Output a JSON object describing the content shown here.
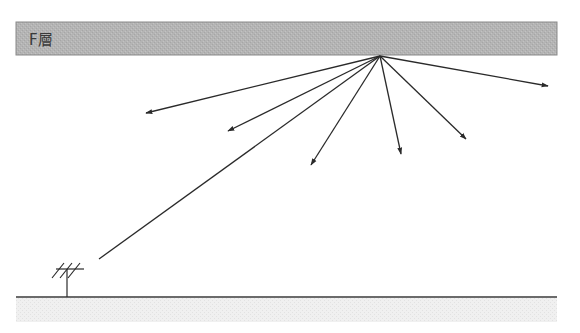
{
  "diagram": {
    "type": "ionospheric-reflection",
    "layer": {
      "label": "F層",
      "fill_color": "#b4b4b4",
      "border_color": "#8a8a8a"
    },
    "incident_ray": {
      "from": "antenna",
      "to": "reflection-point"
    },
    "reflected_rays": {
      "count": 7,
      "color": "#2a2a2a"
    },
    "antenna": {
      "kind": "yagi",
      "elements": 3
    },
    "ground": {
      "line_color": "#3a3a3a",
      "fill_color": "#eeeeee"
    }
  }
}
